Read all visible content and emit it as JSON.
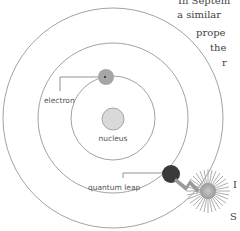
{
  "diagram": {
    "labels": {
      "electron": "electron",
      "nucleus": "nucleus",
      "quantum_leap": "quantum leap"
    },
    "orbits": [
      {
        "name": "inner",
        "radius": 42
      },
      {
        "name": "middle",
        "radius": 75
      },
      {
        "name": "outer",
        "radius": 110
      }
    ],
    "colors": {
      "orbit_stroke": "#8a8a8a",
      "nucleus_fill": "#d9d9d9",
      "electron_fill": "#a6a6a6",
      "leap_electron_fill": "#3a3a3a",
      "burst_fill": "#b8b8b8"
    }
  },
  "side_text": {
    "lines": [
      {
        "text": "In Septem",
        "x": 150,
        "y": 0
      },
      {
        "text": "a similar",
        "x": 176,
        "y": 10
      },
      {
        "text": "prope",
        "x": 196,
        "y": 28
      },
      {
        "text": "the",
        "x": 210,
        "y": 43
      },
      {
        "text": "r",
        "x": 222,
        "y": 58
      },
      {
        "text": "I",
        "x": 231,
        "y": 180
      },
      {
        "text": "S",
        "x": 229,
        "y": 212
      }
    ]
  }
}
